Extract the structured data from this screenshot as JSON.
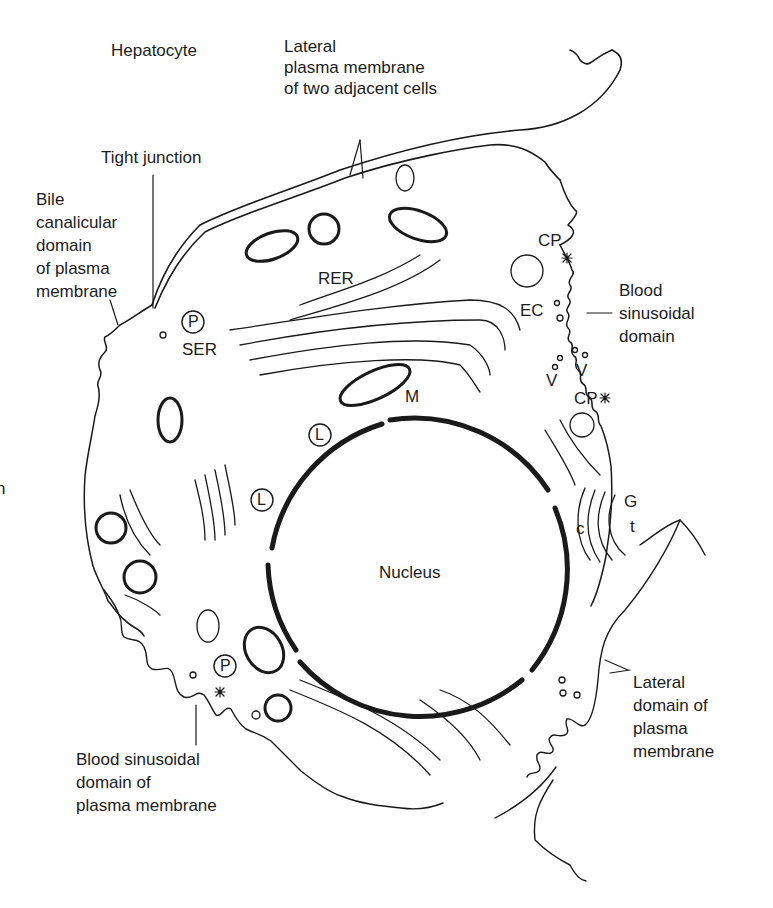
{
  "figure": {
    "title": "Hepatocyte",
    "stroke_color": "#1a1a1a",
    "background": "#ffffff"
  },
  "labels": {
    "hepatocyte": "Hepatocyte",
    "lateral_membrane_two_cells": [
      "Lateral",
      "plasma membrane",
      "of two adjacent cells"
    ],
    "tight_junction": "Tight junction",
    "bile_canalicular": [
      "Bile",
      "canalicular",
      "domain",
      "of plasma",
      "membrane"
    ],
    "rer": "RER",
    "ser": "SER",
    "cp_top": "CP",
    "cp_bottom": "CP",
    "ec": "EC",
    "v_left": "V",
    "v_right": "V",
    "blood_sinusoidal_domain_right": [
      "Blood",
      "sinusoidal",
      "domain"
    ],
    "m": "M",
    "nucleus": "Nucleus",
    "g": "G",
    "c": "c",
    "t": "t",
    "p_top": "P",
    "p_bottom": "P",
    "l_top": "L",
    "l_mid": "L",
    "lateral_domain": [
      "Lateral",
      "domain of",
      "plasma",
      "membrane"
    ],
    "blood_sinusoidal_domain_bottom": [
      "Blood sinusoidal",
      "domain of",
      "plasma membrane"
    ],
    "edge_fragment": "n"
  }
}
